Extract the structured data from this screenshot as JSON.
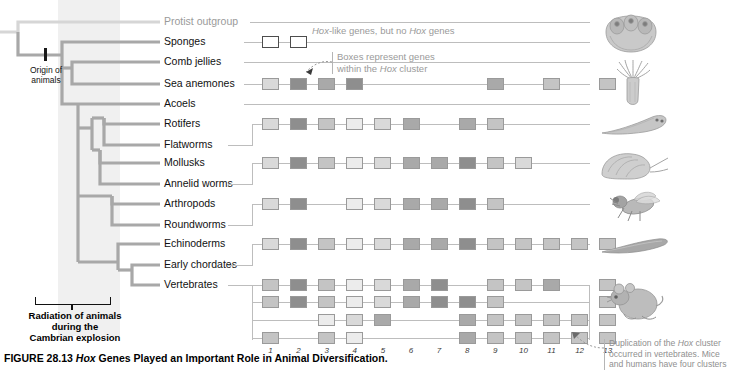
{
  "figure": {
    "number": "FIGURE 28.13",
    "title_italic": "Hox",
    "title_rest": " Genes Played an Important Role in Animal Diversification."
  },
  "tree": {
    "origin_label_line1": "Origin of",
    "origin_label_line2": "animals",
    "cambrian_line1": "Radiation of animals",
    "cambrian_line2": "during the",
    "cambrian_line3": "Cambrian explosion"
  },
  "annotations": {
    "hox_like": {
      "pre": "",
      "italic1": "Hox",
      "mid": "-like genes, but no ",
      "italic2": "Hox",
      "post": " genes"
    },
    "boxes_represent": {
      "line1": "Boxes represent genes",
      "line2_pre": "within the ",
      "line2_italic": "Hox",
      "line2_post": " cluster"
    },
    "duplication": {
      "line1_pre": "Duplication of the ",
      "line1_italic": "Hox",
      "line1_post": " cluster",
      "line2": "occurred in vertebrates. Mice",
      "line3": "and humans have four clusters"
    }
  },
  "column_numbers": [
    "1",
    "2",
    "3",
    "4",
    "5",
    "6",
    "7",
    "8",
    "9",
    "10",
    "11",
    "12",
    "13"
  ],
  "taxa": [
    {
      "name": "Protist outgroup",
      "outgroup": true,
      "organism": null
    },
    {
      "name": "Sponges",
      "outgroup": false,
      "organism": "sponge"
    },
    {
      "name": "Comb jellies",
      "outgroup": false,
      "organism": null
    },
    {
      "name": "Sea anemones",
      "outgroup": false,
      "organism": "sea-anemone"
    },
    {
      "name": "Acoels",
      "outgroup": false,
      "organism": null
    },
    {
      "name": "Rotifers",
      "outgroup": false,
      "organism": null
    },
    {
      "name": "Flatworms",
      "outgroup": false,
      "organism": "flatworm"
    },
    {
      "name": "Mollusks",
      "outgroup": false,
      "organism": "mollusk"
    },
    {
      "name": "Annelid worms",
      "outgroup": false,
      "organism": null
    },
    {
      "name": "Arthropods",
      "outgroup": false,
      "organism": "fly"
    },
    {
      "name": "Roundworms",
      "outgroup": false,
      "organism": null
    },
    {
      "name": "Echinoderms",
      "outgroup": false,
      "organism": null
    },
    {
      "name": "Early chordates",
      "outgroup": false,
      "organism": "lancelet"
    },
    {
      "name": "Vertebrates",
      "outgroup": false,
      "organism": "mouse"
    }
  ],
  "chart_data": {
    "type": "table",
    "title": "Hox Genes Played an Important Role in Animal Diversification",
    "xlabel": "Hox cluster gene position",
    "ylabel": "Animal lineage",
    "categories": [
      "1",
      "2",
      "3",
      "4",
      "5",
      "6",
      "7",
      "8",
      "9",
      "10",
      "11",
      "12",
      "13"
    ],
    "legend": [
      "open box = Hox-like gene (not a Hox gene)",
      "shaded box = gene within the Hox cluster"
    ],
    "rows": [
      {
        "taxon": "Sponges",
        "cluster": "Hox-like",
        "genes": [
          {
            "col": 1,
            "shade": "open"
          },
          {
            "col": 2,
            "shade": "open"
          }
        ]
      },
      {
        "taxon": "Sea anemones",
        "cluster": "single",
        "genes": [
          {
            "col": 1,
            "shade": "l2"
          },
          {
            "col": 2,
            "shade": "l5"
          },
          {
            "col": 3,
            "shade": "l4"
          },
          {
            "col": 4,
            "shade": "l5"
          },
          {
            "col": 9,
            "shade": "l4"
          },
          {
            "col": 11,
            "shade": "l3"
          },
          {
            "col": 13,
            "shade": "l3"
          }
        ]
      },
      {
        "taxon": "Rotifers",
        "cluster": "single",
        "genes": [
          {
            "col": 1,
            "shade": "l2"
          },
          {
            "col": 2,
            "shade": "l5"
          },
          {
            "col": 3,
            "shade": "l3"
          },
          {
            "col": 4,
            "shade": "l1"
          },
          {
            "col": 5,
            "shade": "l2"
          },
          {
            "col": 6,
            "shade": "l4"
          },
          {
            "col": 8,
            "shade": "l4"
          },
          {
            "col": 9,
            "shade": "l3"
          }
        ]
      },
      {
        "taxon": "Mollusks",
        "cluster": "single",
        "genes": [
          {
            "col": 1,
            "shade": "l2"
          },
          {
            "col": 2,
            "shade": "l5"
          },
          {
            "col": 3,
            "shade": "l3"
          },
          {
            "col": 4,
            "shade": "l1"
          },
          {
            "col": 5,
            "shade": "l2"
          },
          {
            "col": 6,
            "shade": "l4"
          },
          {
            "col": 7,
            "shade": "l4"
          },
          {
            "col": 8,
            "shade": "l5"
          },
          {
            "col": 9,
            "shade": "l3"
          },
          {
            "col": 10,
            "shade": "l2"
          }
        ]
      },
      {
        "taxon": "Arthropods",
        "cluster": "single",
        "genes": [
          {
            "col": 1,
            "shade": "l2"
          },
          {
            "col": 2,
            "shade": "l5"
          },
          {
            "col": 4,
            "shade": "l1"
          },
          {
            "col": 5,
            "shade": "l2"
          },
          {
            "col": 6,
            "shade": "l4"
          },
          {
            "col": 7,
            "shade": "l4"
          },
          {
            "col": 8,
            "shade": "l5"
          },
          {
            "col": 9,
            "shade": "l3"
          }
        ]
      },
      {
        "taxon": "Echinoderms",
        "cluster": "single",
        "genes": [
          {
            "col": 1,
            "shade": "l2"
          },
          {
            "col": 2,
            "shade": "l5"
          },
          {
            "col": 3,
            "shade": "l3"
          },
          {
            "col": 4,
            "shade": "l1"
          },
          {
            "col": 5,
            "shade": "l2"
          },
          {
            "col": 6,
            "shade": "l4"
          },
          {
            "col": 7,
            "shade": "l4"
          },
          {
            "col": 8,
            "shade": "l5"
          },
          {
            "col": 9,
            "shade": "l3"
          },
          {
            "col": 10,
            "shade": "l3"
          },
          {
            "col": 11,
            "shade": "l3"
          },
          {
            "col": 12,
            "shade": "l3"
          },
          {
            "col": 13,
            "shade": "l3"
          }
        ]
      },
      {
        "taxon": "Vertebrates A",
        "cluster": "A",
        "genes": [
          {
            "col": 1,
            "shade": "l3"
          },
          {
            "col": 2,
            "shade": "l5"
          },
          {
            "col": 3,
            "shade": "l3"
          },
          {
            "col": 4,
            "shade": "l1"
          },
          {
            "col": 5,
            "shade": "l2"
          },
          {
            "col": 6,
            "shade": "l4"
          },
          {
            "col": 7,
            "shade": "l5"
          },
          {
            "col": 9,
            "shade": "l3"
          },
          {
            "col": 10,
            "shade": "l3"
          },
          {
            "col": 11,
            "shade": "l4"
          },
          {
            "col": 13,
            "shade": "l3"
          }
        ]
      },
      {
        "taxon": "Vertebrates B",
        "cluster": "B",
        "genes": [
          {
            "col": 1,
            "shade": "l3"
          },
          {
            "col": 2,
            "shade": "l5"
          },
          {
            "col": 3,
            "shade": "l3"
          },
          {
            "col": 4,
            "shade": "l1"
          },
          {
            "col": 5,
            "shade": "l2"
          },
          {
            "col": 6,
            "shade": "l4"
          },
          {
            "col": 7,
            "shade": "l5"
          },
          {
            "col": 8,
            "shade": "l5"
          },
          {
            "col": 9,
            "shade": "l3"
          },
          {
            "col": 13,
            "shade": "l3"
          }
        ]
      },
      {
        "taxon": "Vertebrates C",
        "cluster": "C",
        "genes": [
          {
            "col": 3,
            "shade": "l1"
          },
          {
            "col": 4,
            "shade": "l2"
          },
          {
            "col": 5,
            "shade": "l4"
          },
          {
            "col": 8,
            "shade": "l4"
          },
          {
            "col": 9,
            "shade": "l3"
          },
          {
            "col": 10,
            "shade": "l3"
          },
          {
            "col": 11,
            "shade": "l3"
          },
          {
            "col": 12,
            "shade": "l3"
          },
          {
            "col": 13,
            "shade": "l3"
          }
        ]
      },
      {
        "taxon": "Vertebrates D",
        "cluster": "D",
        "genes": [
          {
            "col": 1,
            "shade": "l3"
          },
          {
            "col": 3,
            "shade": "l3"
          },
          {
            "col": 4,
            "shade": "l1"
          },
          {
            "col": 8,
            "shade": "l4"
          },
          {
            "col": 9,
            "shade": "l3"
          },
          {
            "col": 10,
            "shade": "l3"
          },
          {
            "col": 11,
            "shade": "l3"
          },
          {
            "col": 12,
            "shade": "l3"
          },
          {
            "col": 13,
            "shade": "l3"
          }
        ]
      }
    ]
  },
  "colors": {
    "branch": "#a8a8a8",
    "outgroup_branch": "#d6d6d6",
    "axis": "#bdbdbd",
    "annotation_text": "#9a9a9a",
    "band": "#f0f0f0"
  }
}
